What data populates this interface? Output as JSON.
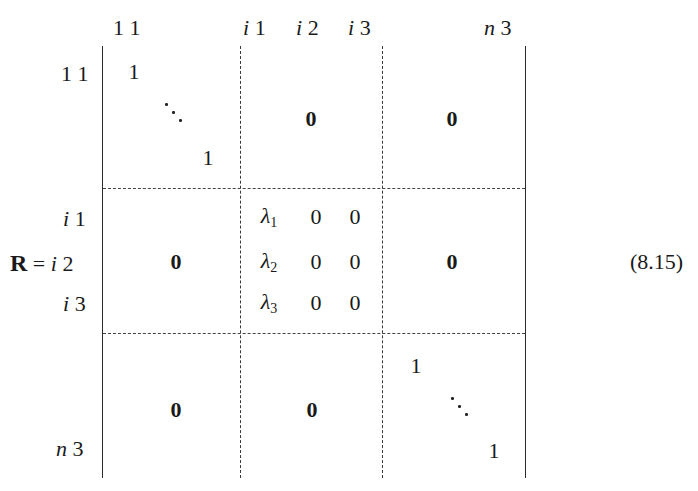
{
  "equation": {
    "lhs": "R",
    "equals": "=",
    "number": "(8.15)"
  },
  "column_labels": [
    {
      "prefix": "",
      "suffix": "1 1"
    },
    {
      "prefix": "i",
      "suffix": "1"
    },
    {
      "prefix": "i",
      "suffix": "2"
    },
    {
      "prefix": "i",
      "suffix": "3"
    },
    {
      "prefix": "n",
      "suffix": "3"
    }
  ],
  "row_labels": [
    {
      "prefix": "",
      "suffix": "1 1"
    },
    {
      "prefix": "i",
      "suffix": "1"
    },
    {
      "prefix": "i",
      "suffix": "2"
    },
    {
      "prefix": "i",
      "suffix": "3"
    },
    {
      "prefix": "n",
      "suffix": "3"
    }
  ],
  "blocks": {
    "top_left": {
      "diag_start": "1",
      "diag_end": "1",
      "ellipsis": "⋱"
    },
    "top_middle": "0",
    "top_right": "0",
    "middle_left": "0",
    "middle_center": {
      "rows": [
        {
          "lambda": "λ",
          "sub": "1",
          "c2": "0",
          "c3": "0"
        },
        {
          "lambda": "λ",
          "sub": "2",
          "c2": "0",
          "c3": "0"
        },
        {
          "lambda": "λ",
          "sub": "3",
          "c2": "0",
          "c3": "0"
        }
      ]
    },
    "middle_right": "0",
    "bottom_left": "0",
    "bottom_middle": "0",
    "bottom_right": {
      "diag_start": "1",
      "diag_end": "1",
      "ellipsis": "⋱"
    }
  }
}
